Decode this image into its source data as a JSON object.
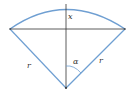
{
  "diagram": {
    "type": "circular-sector",
    "labels": {
      "height": "x",
      "angle": "α",
      "left_radius": "r",
      "right_radius": "r"
    },
    "colors": {
      "arc": "#6f9fd2",
      "radius_lines": "#6f9fd2",
      "chord": "#333333",
      "axis": "#333333",
      "angle_arc": "#6f9fd2"
    }
  }
}
